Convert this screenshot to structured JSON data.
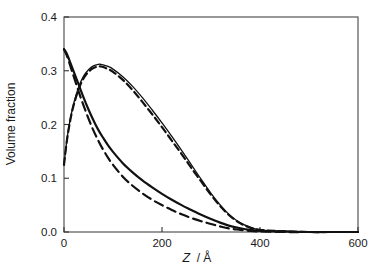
{
  "chart_data": {
    "type": "line",
    "title": "",
    "xlabel": "Z / Å",
    "xlabel_symbol": "Z",
    "xlabel_unit": "/ Å",
    "ylabel": "Volume fraction",
    "xlim": [
      0,
      600
    ],
    "ylim": [
      0.0,
      0.4
    ],
    "xticks": [
      0,
      200,
      400,
      600
    ],
    "xtick_labels": [
      "0",
      "200",
      "400",
      "600"
    ],
    "yticks": [
      0.0,
      0.1,
      0.2,
      0.3,
      0.4
    ],
    "ytick_labels": [
      "0.0",
      "0.1",
      "0.2",
      "0.3",
      "0.4"
    ],
    "grid": false,
    "legend": null,
    "frame": "box",
    "tick_direction": "in",
    "line_color": "#111111",
    "frame_color": "#555555",
    "series": [
      {
        "name": "decaying-solid",
        "style": "solid",
        "width": 2.2,
        "x": [
          0,
          5,
          10,
          15,
          20,
          30,
          40,
          50,
          60,
          70,
          80,
          90,
          100,
          120,
          140,
          160,
          180,
          200,
          220,
          240,
          260,
          280,
          300,
          320,
          340,
          360,
          380,
          400,
          450,
          500,
          550,
          600
        ],
        "y": [
          0.34,
          0.333,
          0.322,
          0.31,
          0.298,
          0.274,
          0.25,
          0.228,
          0.208,
          0.19,
          0.175,
          0.161,
          0.149,
          0.128,
          0.111,
          0.096,
          0.083,
          0.071,
          0.06,
          0.05,
          0.041,
          0.032,
          0.024,
          0.017,
          0.011,
          0.007,
          0.004,
          0.002,
          0.001,
          0.0,
          0.0,
          0.0
        ]
      },
      {
        "name": "decaying-dashed",
        "style": "dashed",
        "width": 2.2,
        "dash": "9,5",
        "x": [
          0,
          5,
          10,
          15,
          20,
          30,
          40,
          50,
          60,
          70,
          80,
          90,
          100,
          120,
          140,
          160,
          180,
          200,
          220,
          240,
          260,
          280,
          300,
          320,
          340,
          360,
          380,
          400,
          450,
          500,
          550,
          600
        ],
        "y": [
          0.34,
          0.33,
          0.317,
          0.303,
          0.289,
          0.261,
          0.235,
          0.211,
          0.189,
          0.17,
          0.153,
          0.138,
          0.125,
          0.103,
          0.086,
          0.072,
          0.06,
          0.05,
          0.041,
          0.033,
          0.026,
          0.02,
          0.015,
          0.01,
          0.006,
          0.004,
          0.002,
          0.001,
          0.0,
          0.0,
          0.0,
          0.0
        ]
      },
      {
        "name": "peaked-solid",
        "style": "solid",
        "width": 1.3,
        "x": [
          0,
          5,
          10,
          15,
          20,
          30,
          40,
          50,
          60,
          70,
          75,
          80,
          90,
          100,
          120,
          140,
          160,
          180,
          200,
          220,
          240,
          260,
          280,
          300,
          320,
          340,
          360,
          380,
          400,
          450,
          500,
          550,
          600
        ],
        "y": [
          0.125,
          0.165,
          0.196,
          0.22,
          0.24,
          0.27,
          0.29,
          0.302,
          0.309,
          0.312,
          0.312,
          0.311,
          0.308,
          0.303,
          0.289,
          0.271,
          0.25,
          0.227,
          0.203,
          0.178,
          0.152,
          0.125,
          0.098,
          0.072,
          0.049,
          0.03,
          0.017,
          0.009,
          0.004,
          0.001,
          0.0,
          0.0,
          0.0
        ]
      },
      {
        "name": "peaked-dashed",
        "style": "dashed",
        "width": 2.2,
        "dash": "7,4",
        "x": [
          0,
          5,
          10,
          15,
          20,
          30,
          40,
          50,
          60,
          70,
          75,
          80,
          90,
          100,
          120,
          140,
          160,
          180,
          200,
          220,
          240,
          260,
          280,
          300,
          320,
          340,
          360,
          380,
          400,
          450,
          500,
          550,
          600
        ],
        "y": [
          0.125,
          0.164,
          0.194,
          0.218,
          0.237,
          0.266,
          0.286,
          0.298,
          0.305,
          0.308,
          0.308,
          0.307,
          0.303,
          0.298,
          0.283,
          0.264,
          0.242,
          0.219,
          0.195,
          0.17,
          0.145,
          0.119,
          0.094,
          0.069,
          0.047,
          0.029,
          0.016,
          0.008,
          0.004,
          0.001,
          0.0,
          0.0,
          0.0
        ]
      }
    ]
  }
}
